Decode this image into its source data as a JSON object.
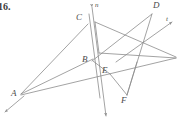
{
  "problem": {
    "number": "16."
  },
  "figure": {
    "stroke_color": "#8c8c8c",
    "label_color": "#4a4a4a",
    "background": "#ffffff",
    "points": [
      {
        "name": "A",
        "label": "A",
        "x": 20,
        "y": 95,
        "label_x": 11,
        "label_y": 92
      },
      {
        "name": "B",
        "label": "B",
        "x": 92,
        "y": 60,
        "label_x": 83,
        "label_y": 58
      },
      {
        "name": "C",
        "label": "C",
        "x": 88,
        "y": 23,
        "label_x": 77,
        "label_y": 17
      },
      {
        "name": "D",
        "label": "D",
        "x": 152,
        "y": 13,
        "label_x": 154,
        "label_y": 3
      },
      {
        "name": "E",
        "label": "E",
        "x": 110,
        "y": 73,
        "label_x": 103,
        "label_y": 70
      },
      {
        "name": "F",
        "label": "F",
        "x": 127,
        "y": 97,
        "label_x": 122,
        "label_y": 97
      }
    ],
    "lines": [
      {
        "name": "n",
        "label": "n",
        "label_x": 95,
        "label_y": 3,
        "description": "near-vertical line through B with arrows both ends"
      },
      {
        "name": "t",
        "label": "t",
        "label_x": 166,
        "label_y": 17,
        "description": "ray to upper right with arrowhead"
      }
    ]
  }
}
